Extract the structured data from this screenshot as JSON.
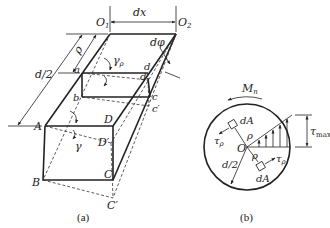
{
  "figure_a": {
    "caption": "(a)",
    "labels": {
      "O1": "O",
      "O1_sub": "1",
      "O2": "O",
      "O2_sub": "2",
      "dx": "dx",
      "dphi": "dφ",
      "rho": "ρ",
      "d_half": "d/2",
      "gamma_rho": "γ",
      "gamma_rho_sub": "ρ",
      "gamma": "γ",
      "a": "a",
      "b": "b",
      "c": "c",
      "c_prime": "c′",
      "d": "d",
      "d_prime": "d′",
      "A": "A",
      "B": "B",
      "C": "C",
      "C_prime": "C′",
      "D": "D",
      "D_prime": "D′"
    }
  },
  "figure_b": {
    "caption": "(b)",
    "labels": {
      "Mn": "M",
      "Mn_sub": "n",
      "dA_top": "dA",
      "dA_bottom": "dA",
      "tau_left": "τ",
      "tau_left_sub": "ρ",
      "tau_right": "τ",
      "tau_right_sub": "ρ",
      "rho_top": "ρ",
      "rho_bottom": "ρ",
      "O": "O",
      "d_half": "d/2",
      "tau_max": "τ",
      "tau_max_sub": "max"
    }
  }
}
